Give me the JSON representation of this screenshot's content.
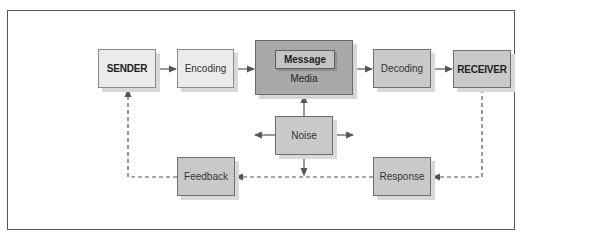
{
  "diagram": {
    "type": "communication-process-flow",
    "nodes": {
      "sender": {
        "label": "SENDER"
      },
      "encoding": {
        "label": "Encoding"
      },
      "message": {
        "label": "Message"
      },
      "media": {
        "label": "Media"
      },
      "decoding": {
        "label": "Decoding"
      },
      "receiver": {
        "label": "RECEIVER"
      },
      "noise": {
        "label": "Noise"
      },
      "feedback": {
        "label": "Feedback"
      },
      "response": {
        "label": "Response"
      }
    },
    "edges": [
      {
        "from": "SENDER",
        "to": "Encoding",
        "style": "solid"
      },
      {
        "from": "Encoding",
        "to": "Media",
        "style": "solid"
      },
      {
        "from": "Media",
        "to": "Decoding",
        "style": "solid"
      },
      {
        "from": "Decoding",
        "to": "RECEIVER",
        "style": "solid"
      },
      {
        "from": "Noise",
        "to": "Media",
        "style": "solid"
      },
      {
        "from": "Noise",
        "to": "left",
        "style": "solid"
      },
      {
        "from": "Noise",
        "to": "right",
        "style": "solid"
      },
      {
        "from": "Noise",
        "to": "feedback-line",
        "style": "solid"
      },
      {
        "from": "RECEIVER",
        "to": "Response",
        "style": "dashed"
      },
      {
        "from": "Response",
        "to": "Feedback",
        "style": "dashed"
      },
      {
        "from": "Feedback",
        "to": "SENDER",
        "style": "dashed"
      }
    ],
    "colors": {
      "light_box": "#ebebeb",
      "mid_box": "#c9c9c9",
      "media_box": "#a9a9a9",
      "line": "#555555"
    }
  }
}
